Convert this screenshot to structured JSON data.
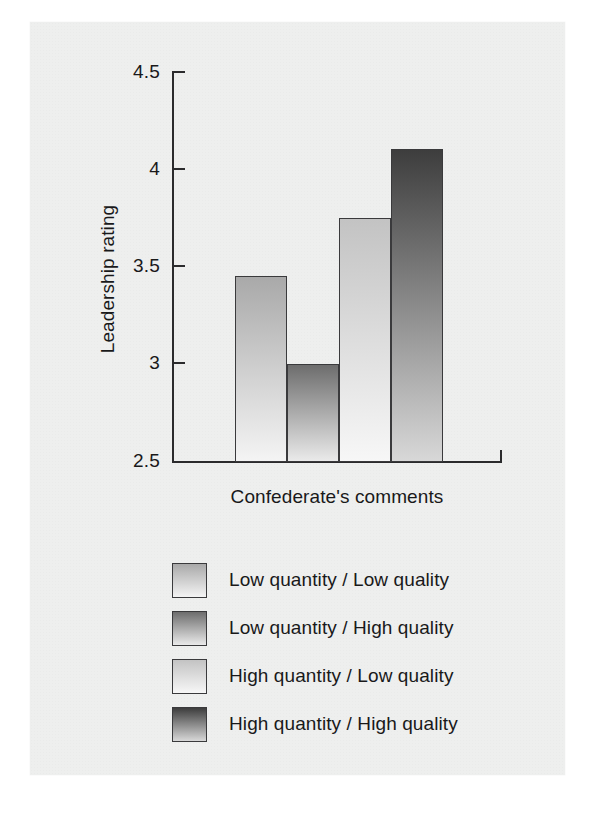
{
  "chart_data": {
    "type": "bar",
    "title": "",
    "xlabel": "Confederate's comments",
    "ylabel": "Leadership rating",
    "ylim": [
      2.5,
      4.5
    ],
    "yticks": [
      "2.5",
      "3",
      "3.5",
      "4",
      "4.5"
    ],
    "ytick_values": [
      2.5,
      3,
      3.5,
      4,
      4.5
    ],
    "grid": false,
    "legend_position": "below",
    "categories": [
      "Low quantity / Low quality",
      "Low quantity / High quality",
      "High quantity / Low quality",
      "High quantity / High quality"
    ],
    "values": [
      3.45,
      3.0,
      3.75,
      4.1
    ],
    "bar_colors_top": [
      "#a9a9a9",
      "#6d6d6d",
      "#c3c3c3",
      "#3d3d3d"
    ],
    "bar_colors_bottom": [
      "#f4f4f4",
      "#eaeaea",
      "#f7f7f7",
      "#d8d8d8"
    ],
    "bar_edge_color": "#3a3a3c",
    "axis_color": "#2b2b2d",
    "background_color": "#eeefee"
  },
  "axis": {
    "y_title": "Leadership rating",
    "x_title": "Confederate's comments",
    "y_ticks": [
      {
        "label": "4.5",
        "value": 4.5
      },
      {
        "label": "4",
        "value": 4
      },
      {
        "label": "3.5",
        "value": 3.5
      },
      {
        "label": "3",
        "value": 3
      },
      {
        "label": "2.5",
        "value": 2.5
      }
    ]
  },
  "legend": {
    "items": [
      {
        "label": "Low quantity / Low quality",
        "swatch_top": "#a9a9a9",
        "swatch_bottom": "#f4f4f4"
      },
      {
        "label": "Low quantity / High quality",
        "swatch_top": "#6d6d6d",
        "swatch_bottom": "#eaeaea"
      },
      {
        "label": "High quantity / Low quality",
        "swatch_top": "#c3c3c3",
        "swatch_bottom": "#f7f7f7"
      },
      {
        "label": "High quantity / High quality",
        "swatch_top": "#3d3d3d",
        "swatch_bottom": "#d8d8d8"
      }
    ]
  },
  "caption": {
    "sliver_text": ""
  }
}
